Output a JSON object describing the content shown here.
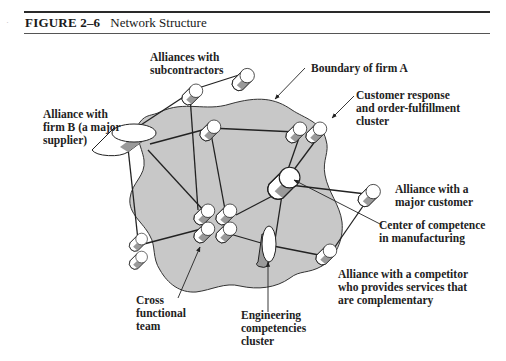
{
  "figure": {
    "number": "FIGURE 2–6",
    "title": "Network Structure"
  },
  "diagram": {
    "boundary_label": "Boundary of firm A",
    "colors": {
      "firm_fill": "#c8c8c8",
      "cylinder_side": "#9a9a9a",
      "cylinder_face": "#ffffff",
      "stroke": "#222222"
    },
    "labels": {
      "subcontractors": [
        "Alliances with",
        "subcontractors"
      ],
      "boundary": [
        "Boundary of firm A"
      ],
      "customer_response": [
        "Customer response",
        "and order-fulfillment",
        "cluster"
      ],
      "firm_b": [
        "Alliance with",
        "firm B (a major",
        "supplier)"
      ],
      "major_customer": [
        "Alliance with a",
        "major customer"
      ],
      "center_competence": [
        "Center of competence",
        "in manufacturing"
      ],
      "competitor": [
        "Alliance with a competitor",
        "who provides services that",
        "are complementary"
      ],
      "cross_functional": [
        "Cross",
        "functional",
        "team"
      ],
      "engineering": [
        "Engineering",
        "competencies",
        "cluster"
      ]
    }
  }
}
